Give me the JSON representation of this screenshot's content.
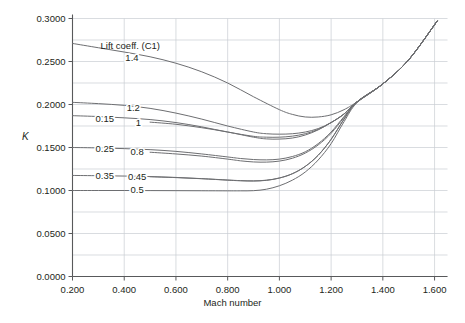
{
  "chart_data": {
    "type": "line",
    "title": "",
    "xlabel": "Mach number",
    "ylabel": "K",
    "legend_title": "Lift coeff. (C1)",
    "legend_position": "inline-labels",
    "grid": true,
    "xlim": [
      0.2,
      1.65
    ],
    "ylim": [
      0.0,
      0.3
    ],
    "xticks": [
      "0.200",
      "0.400",
      "0.600",
      "0.800",
      "1.000",
      "1.200",
      "1.400",
      "1.600"
    ],
    "xtick_values": [
      0.2,
      0.4,
      0.6,
      0.8,
      1.0,
      1.2,
      1.4,
      1.6
    ],
    "yticks": [
      "0.0000",
      "0.0500",
      "0.1000",
      "0.1500",
      "0.2000",
      "0.2500",
      "0.3000"
    ],
    "ytick_values": [
      0.0,
      0.05,
      0.1,
      0.15,
      0.2,
      0.25,
      0.3
    ],
    "series": [
      {
        "name": "1.4",
        "label": "1.4",
        "x": [
          0.2,
          0.3,
          0.4,
          0.5,
          0.6,
          0.7,
          0.8,
          0.9,
          1.0,
          1.05,
          1.1,
          1.15,
          1.2,
          1.25,
          1.3,
          1.4,
          1.5,
          1.61
        ],
        "values": [
          0.271,
          0.266,
          0.261,
          0.2555,
          0.248,
          0.238,
          0.225,
          0.209,
          0.194,
          0.1885,
          0.1855,
          0.1855,
          0.188,
          0.194,
          0.203,
          0.224,
          0.252,
          0.297
        ]
      },
      {
        "name": "1.2",
        "label": "1.2",
        "x": [
          0.2,
          0.3,
          0.4,
          0.5,
          0.6,
          0.7,
          0.8,
          0.9,
          0.95,
          1.0,
          1.05,
          1.1,
          1.15,
          1.2,
          1.25,
          1.3,
          1.4,
          1.5,
          1.61
        ],
        "values": [
          0.2025,
          0.201,
          0.199,
          0.1955,
          0.19,
          0.183,
          0.175,
          0.168,
          0.166,
          0.1655,
          0.166,
          0.168,
          0.172,
          0.179,
          0.189,
          0.203,
          0.224,
          0.252,
          0.297
        ]
      },
      {
        "name": "0.15",
        "label": "0.15",
        "x": [
          0.2,
          0.3,
          0.4,
          0.5,
          0.6,
          0.7,
          0.8,
          0.9,
          0.95,
          1.0,
          1.05,
          1.1,
          1.15,
          1.2,
          1.25,
          1.3,
          1.4,
          1.5,
          1.61
        ],
        "values": [
          0.187,
          0.186,
          0.1845,
          0.1825,
          0.179,
          0.174,
          0.168,
          0.163,
          0.162,
          0.162,
          0.1632,
          0.166,
          0.171,
          0.179,
          0.189,
          0.203,
          0.224,
          0.252,
          0.297
        ]
      },
      {
        "name": "1",
        "label": "1",
        "x": [
          0.5,
          0.6,
          0.7,
          0.8,
          0.9,
          0.95,
          1.0,
          1.05,
          1.1,
          1.15,
          1.2,
          1.25,
          1.3,
          1.4,
          1.5,
          1.61
        ],
        "values": [
          0.1795,
          0.177,
          0.173,
          0.168,
          0.162,
          0.16,
          0.1598,
          0.161,
          0.1645,
          0.1705,
          0.179,
          0.189,
          0.203,
          0.224,
          0.252,
          0.297
        ]
      },
      {
        "name": "0.25",
        "label": "0.25",
        "x": [
          0.2,
          0.3,
          0.4,
          0.5,
          0.6,
          0.7,
          0.8,
          0.85,
          0.9,
          0.95,
          1.0,
          1.05,
          1.1,
          1.15,
          1.2,
          1.25,
          1.3,
          1.4,
          1.5,
          1.61
        ],
        "values": [
          0.15,
          0.1495,
          0.1487,
          0.1475,
          0.1455,
          0.1425,
          0.139,
          0.1372,
          0.136,
          0.1356,
          0.1365,
          0.1395,
          0.145,
          0.1545,
          0.168,
          0.186,
          0.203,
          0.224,
          0.252,
          0.297
        ]
      },
      {
        "name": "0.8",
        "label": "0.8",
        "x": [
          0.5,
          0.6,
          0.7,
          0.8,
          0.85,
          0.9,
          0.95,
          1.0,
          1.05,
          1.1,
          1.15,
          1.2,
          1.25,
          1.3,
          1.4,
          1.5,
          1.61
        ],
        "values": [
          0.1445,
          0.1425,
          0.14,
          0.1365,
          0.1345,
          0.1332,
          0.133,
          0.1342,
          0.1375,
          0.1435,
          0.153,
          0.1665,
          0.185,
          0.203,
          0.224,
          0.252,
          0.297
        ]
      },
      {
        "name": "0.35",
        "label": "0.35",
        "x": [
          0.2,
          0.3,
          0.4,
          0.5,
          0.6,
          0.7,
          0.8,
          0.85,
          0.9,
          0.95,
          1.0,
          1.05,
          1.1,
          1.15,
          1.2,
          1.25,
          1.3,
          1.4,
          1.5,
          1.61
        ],
        "values": [
          0.1175,
          0.1172,
          0.1168,
          0.1162,
          0.1152,
          0.1138,
          0.1122,
          0.1115,
          0.1112,
          0.112,
          0.1145,
          0.1195,
          0.128,
          0.141,
          0.1595,
          0.183,
          0.203,
          0.224,
          0.252,
          0.297
        ]
      },
      {
        "name": "0.45",
        "label": "0.45",
        "x": [
          0.5,
          0.6,
          0.7,
          0.8,
          0.85,
          0.9,
          0.95,
          1.0,
          1.05,
          1.1,
          1.15,
          1.2,
          1.25,
          1.3,
          1.4,
          1.5,
          1.61
        ],
        "values": [
          0.116,
          0.115,
          0.1137,
          0.112,
          0.1113,
          0.111,
          0.1118,
          0.1145,
          0.1195,
          0.128,
          0.141,
          0.1595,
          0.183,
          0.203,
          0.224,
          0.252,
          0.297
        ]
      },
      {
        "name": "0.5",
        "label": "0.5",
        "x": [
          0.2,
          0.3,
          0.4,
          0.5,
          0.6,
          0.7,
          0.8,
          0.85,
          0.9,
          0.95,
          1.0,
          1.05,
          1.1,
          1.15,
          1.2,
          1.25,
          1.3,
          1.4,
          1.5,
          1.61
        ],
        "values": [
          0.1,
          0.1,
          0.1,
          0.0999,
          0.0998,
          0.0997,
          0.0996,
          0.0996,
          0.0998,
          0.1015,
          0.1055,
          0.112,
          0.1215,
          0.1355,
          0.1545,
          0.18,
          0.202,
          0.224,
          0.252,
          0.297
        ]
      }
    ],
    "inline_labels": [
      {
        "text": "1.4",
        "x": 0.43,
        "y": 0.2545
      },
      {
        "text": "1.2",
        "x": 0.435,
        "y": 0.1965
      },
      {
        "text": "0.15",
        "x": 0.325,
        "y": 0.1835
      },
      {
        "text": "1",
        "x": 0.455,
        "y": 0.179
      },
      {
        "text": "0.25",
        "x": 0.325,
        "y": 0.149
      },
      {
        "text": "0.8",
        "x": 0.45,
        "y": 0.145
      },
      {
        "text": "0.35",
        "x": 0.325,
        "y": 0.1168
      },
      {
        "text": "0.45",
        "x": 0.45,
        "y": 0.116
      },
      {
        "text": "0.5",
        "x": 0.45,
        "y": 0.1008
      }
    ],
    "colors": {
      "line": "#6d6e71",
      "grid": "#c9cdd2",
      "axis": "#58595b",
      "text": "#231f20",
      "background": "#ffffff"
    }
  }
}
